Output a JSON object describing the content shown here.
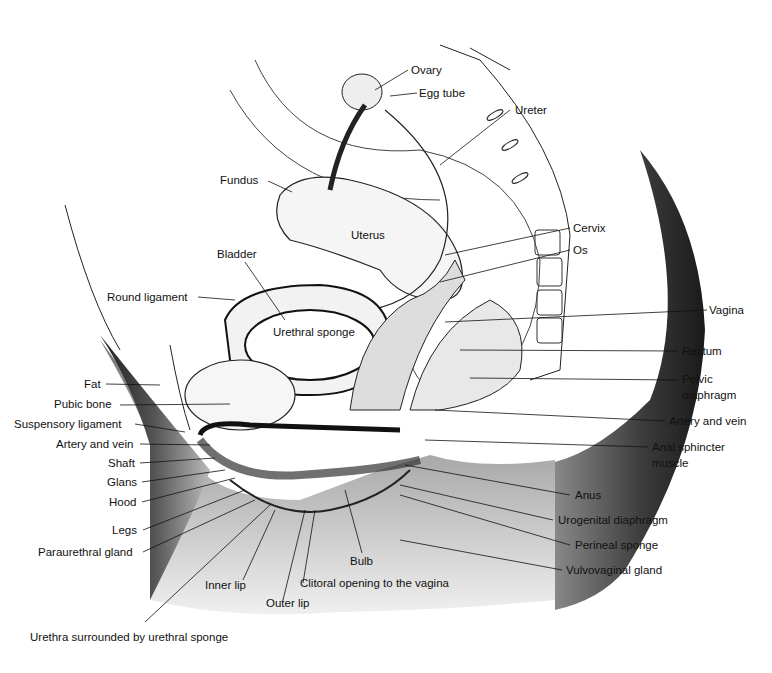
{
  "diagram": {
    "type": "anatomical cross-section",
    "labels": {
      "ovary": "Ovary",
      "egg_tube": "Egg tube",
      "ureter": "Ureter",
      "fundus": "Fundus",
      "uterus": "Uterus",
      "cervix": "Cervix",
      "os": "Os",
      "bladder": "Bladder",
      "round_ligament": "Round ligament",
      "urethral_sponge": "Urethral sponge",
      "vagina": "Vagina",
      "rectum": "Rectum",
      "pelvic_diaphragm_1": "Pelvic",
      "pelvic_diaphragm_2": "diaphragm",
      "artery_vein_right": "Artery and vein",
      "anal_sphincter_1": "Anal sphincter",
      "anal_sphincter_2": "muscle",
      "fat": "Fat",
      "pubic_bone": "Pubic bone",
      "suspensory_ligament": "Suspensory ligament",
      "artery_vein_left": "Artery and vein",
      "shaft": "Shaft",
      "glans": "Glans",
      "hood": "Hood",
      "legs": "Legs",
      "paraurethral_gland": "Paraurethral gland",
      "anus": "Anus",
      "urogenital_diaphragm": "Urogenital diaphragm",
      "perineal_sponge": "Perineal sponge",
      "vulvovaginal_gland": "Vulvovaginal gland",
      "bulb": "Bulb",
      "inner_lip": "Inner lip",
      "clitoral_opening": "Clitoral opening to the vagina",
      "outer_lip": "Outer lip",
      "urethra": "Urethra surrounded by urethral sponge"
    },
    "colors": {
      "ink": "#111111",
      "shade_dark": "#2a2a2a",
      "shade_mid": "#777777",
      "paper": "#ffffff"
    }
  }
}
